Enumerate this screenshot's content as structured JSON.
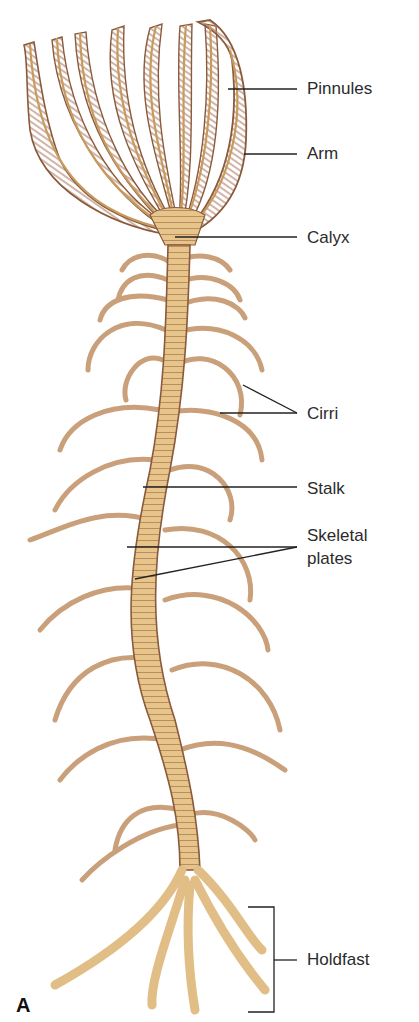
{
  "figure": {
    "panel_letter": "A",
    "colors": {
      "body_fill": "#e6c48a",
      "body_light": "#f2dcae",
      "outline": "#8a5a3c",
      "pinnule": "#b88d78",
      "leader_line": "#222222",
      "label_text": "#2b2b2b"
    }
  },
  "labels": [
    {
      "id": "pinnules",
      "text": "Pinnules",
      "x": 307,
      "y": 79
    },
    {
      "id": "arm",
      "text": "Arm",
      "x": 307,
      "y": 144
    },
    {
      "id": "calyx",
      "text": "Calyx",
      "x": 307,
      "y": 228
    },
    {
      "id": "cirri",
      "text": "Cirri",
      "x": 307,
      "y": 404
    },
    {
      "id": "stalk",
      "text": "Stalk",
      "x": 307,
      "y": 479
    },
    {
      "id": "skeletal_plates_1",
      "text": "Skeletal",
      "x": 307,
      "y": 526
    },
    {
      "id": "skeletal_plates_2",
      "text": "plates",
      "x": 307,
      "y": 549
    },
    {
      "id": "holdfast",
      "text": "Holdfast",
      "x": 307,
      "y": 950
    }
  ]
}
